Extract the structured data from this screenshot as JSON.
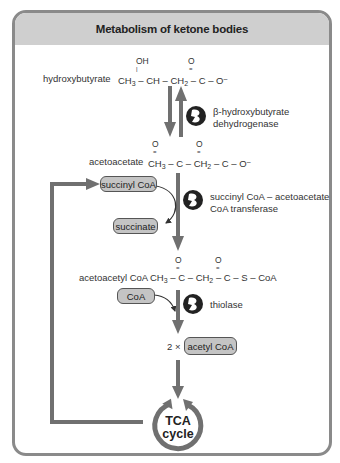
{
  "title": "Metabolism of ketone bodies",
  "colors": {
    "frame_border": "#8a8a8a",
    "header_bg": "#cfcfcf",
    "arrow": "#707070",
    "pill_bg": "#c4c4c4",
    "enzyme_icon": "#222222"
  },
  "compounds": [
    {
      "name": "hydroxybutyrate",
      "formula": {
        "parts": [
          "CH",
          "3",
          " – CH – CH",
          "2",
          " – C – O",
          "–"
        ],
        "substituents": [
          "OH",
          "O"
        ]
      }
    },
    {
      "name": "acetoacetate",
      "formula": {
        "parts": [
          "CH",
          "3",
          " – C – CH",
          "2",
          " – C – O",
          "–"
        ],
        "substituents": [
          "O",
          "O"
        ]
      }
    },
    {
      "name": "acetoacetyl CoA",
      "formula": {
        "parts": [
          "CH",
          "3",
          " – C – CH",
          "2",
          " – C – S – CoA"
        ],
        "substituents": [
          "O",
          "O"
        ]
      }
    }
  ],
  "enzymes": [
    {
      "line1": "β-hydroxybutyrate",
      "line2": "dehydrogenase"
    },
    {
      "line1": "succinyl CoA – acetoacetate",
      "line2": "CoA transferase"
    },
    {
      "line1": "thiolase",
      "line2": ""
    }
  ],
  "cofactors": {
    "succinyl_coa": "succinyl CoA",
    "succinate": "succinate",
    "coa": "CoA",
    "acetyl_coa": "acetyl CoA",
    "acetyl_multiplier": "2 ×"
  },
  "tca": {
    "line1": "TCA",
    "line2": "cycle"
  }
}
